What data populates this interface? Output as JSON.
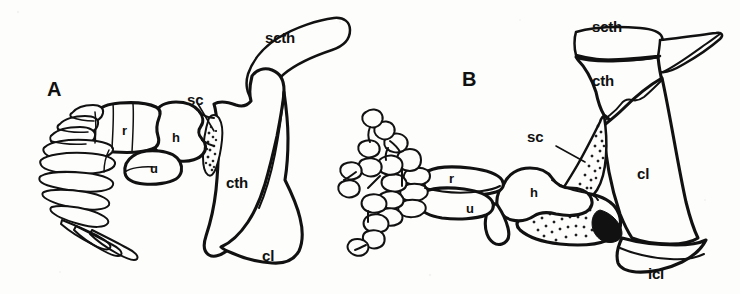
{
  "figure": {
    "background_color": "#fdfdfc",
    "ink_color": "#111111",
    "panels": [
      {
        "id": "A",
        "label": "A",
        "description": "Pectoral girdle and paddle-like fin skeleton, lateral view",
        "labels": [
          {
            "key": "scth",
            "text": "scth",
            "leader": false
          },
          {
            "key": "sc",
            "text": "sc",
            "leader": true
          },
          {
            "key": "cth",
            "text": "cth",
            "leader": false
          },
          {
            "key": "cl",
            "text": "cl",
            "leader": false
          },
          {
            "key": "h",
            "text": "h",
            "leader": false
          },
          {
            "key": "r",
            "text": "r",
            "leader": false
          },
          {
            "key": "u",
            "text": "u",
            "leader": false
          }
        ]
      },
      {
        "id": "B",
        "label": "B",
        "description": "Pectoral girdle and forelimb with digits, lateral view",
        "labels": [
          {
            "key": "scth",
            "text": "scth",
            "leader": false
          },
          {
            "key": "cth",
            "text": "cth",
            "leader": false
          },
          {
            "key": "sc",
            "text": "sc",
            "leader": true
          },
          {
            "key": "cl",
            "text": "cl",
            "leader": false
          },
          {
            "key": "icl",
            "text": "icl",
            "leader": false
          },
          {
            "key": "h",
            "text": "h",
            "leader": false
          },
          {
            "key": "r",
            "text": "r",
            "leader": false
          },
          {
            "key": "u",
            "text": "u",
            "leader": false
          }
        ]
      }
    ],
    "abbreviations": {
      "scth": "scth",
      "sc": "sc",
      "cth": "cth",
      "cl": "cl",
      "icl": "icl",
      "h": "h",
      "r": "r",
      "u": "u"
    }
  }
}
